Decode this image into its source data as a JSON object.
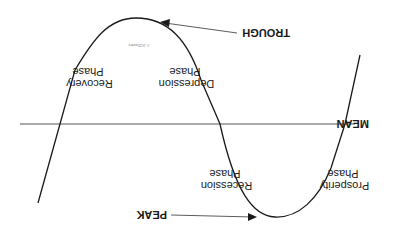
{
  "diagram": {
    "orientation": "rotated 180 degrees",
    "colors": {
      "line": "#1a1a1a",
      "mean_line": "#555555",
      "background": "#ffffff"
    },
    "mean_label": "MEAN",
    "markers": {
      "peak": "PEAK",
      "trough": "TROUGH"
    },
    "phases": [
      {
        "line1": "Prosperity",
        "line2": "Phase"
      },
      {
        "line1": "Recession",
        "line2": "Phase"
      },
      {
        "line1": "Depression",
        "line2": "Phase"
      },
      {
        "line1": "Recovery",
        "line2": "Phase"
      }
    ],
    "credit": "© JCDavies"
  }
}
